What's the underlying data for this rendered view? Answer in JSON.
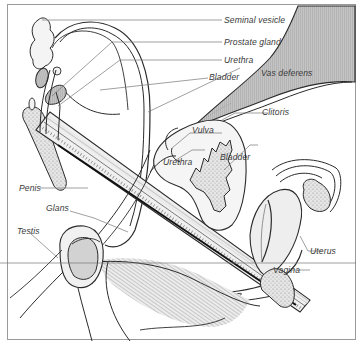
{
  "figure": {
    "type": "anatomical-diagram",
    "colors": {
      "line": "#2a2a2a",
      "leader": "#777777",
      "fill_light": "#e2e2e2",
      "fill_mid": "#cfcfcf",
      "fill_dark": "#bdbdbd",
      "border": "#9a9a9a"
    }
  },
  "labels": {
    "seminal_vesicle": "Seminal vesicle",
    "prostate_gland": "Prostate gland",
    "urethra_male": "Urethra",
    "bladder_male": "Bladder",
    "vas_deferens": "Vas deferens",
    "clitoris": "Clitoris",
    "vulva": "Vulva",
    "urethra_female": "Urethra",
    "bladder_female": "Bladder",
    "penis": "Penis",
    "glans": "Glans",
    "testis": "Testis",
    "uterus": "Uterus",
    "vagina": "Vagina"
  }
}
